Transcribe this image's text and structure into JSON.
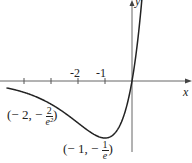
{
  "chart_data": {
    "type": "line",
    "title": "",
    "function": "y = x e^x",
    "xlabel": "x",
    "ylabel": "y",
    "tick_labels": [
      "-2",
      "-1"
    ],
    "ticks_x": [
      -4,
      -3,
      -2,
      -1
    ],
    "xlim": [
      -4.9,
      2.2
    ],
    "ylim": [
      -0.5,
      0.55
    ],
    "annotations": [
      {
        "label": "(-2, -2/e²)",
        "x": -2,
        "y": -0.2707,
        "prefix": "(− 2, −",
        "num": "2",
        "den": "e²",
        "suffix": ")"
      },
      {
        "label": "(-1, -1/e)",
        "x": -1,
        "y": -0.3679,
        "prefix": "(− 1, −",
        "num": "1",
        "den": "e",
        "suffix": ")"
      }
    ],
    "grid": false
  },
  "colors": {
    "curve": "#222222",
    "axis": "#555555",
    "background": "#ffffff"
  }
}
